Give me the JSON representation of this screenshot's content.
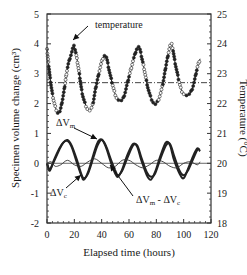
{
  "chart_data": {
    "type": "line",
    "title": "",
    "xlabel": "Elapsed time (hours)",
    "ylabel": "Specimen volume change (cm³)",
    "ylabel_right": "Temperature (°C)",
    "xlim": [
      0,
      120
    ],
    "ylim": [
      -2,
      5
    ],
    "ylim_right": [
      18,
      25
    ],
    "x_ticks": [
      0,
      20,
      40,
      60,
      80,
      100,
      120
    ],
    "y_ticks": [
      -2,
      -1,
      0,
      1,
      2,
      3,
      4,
      5
    ],
    "y_ticks_right": [
      18,
      19,
      20,
      21,
      22,
      23,
      24,
      25
    ],
    "grid": false,
    "reference_lines": [
      {
        "axis": "right",
        "value": 22.7,
        "style": "dash-dot",
        "label": "mean temperature"
      },
      {
        "axis": "left",
        "value": 0,
        "style": "solid-thin",
        "label": "zero volume change"
      }
    ],
    "annotations": [
      {
        "text": "temperature",
        "arrow_to": [
          20,
          23.9
        ],
        "axis": "right"
      },
      {
        "text": "ΔVm",
        "arrow_to": [
          38,
          0.75
        ],
        "axis": "left"
      },
      {
        "text": "ΔVc",
        "arrow_to": [
          26,
          -0.5
        ],
        "axis": "left"
      },
      {
        "text": "ΔVm - ΔVc",
        "arrow_to": [
          62,
          0.0
        ],
        "axis": "left"
      }
    ],
    "series": [
      {
        "name": "temperature",
        "axis": "right",
        "style": "markers+line",
        "x": [
          0,
          3,
          6,
          9,
          12,
          15,
          18,
          20,
          23,
          26,
          30,
          33,
          36,
          40,
          43,
          46,
          50,
          53,
          56,
          60,
          64,
          67,
          70,
          74,
          77,
          80,
          84,
          88,
          91,
          94,
          98,
          101,
          104,
          107,
          110,
          112
        ],
        "values": [
          23.8,
          22.6,
          21.9,
          21.7,
          22.3,
          23.2,
          23.7,
          23.9,
          23.2,
          22.3,
          21.8,
          21.9,
          22.6,
          23.4,
          23.6,
          23.0,
          22.3,
          22.1,
          22.2,
          22.9,
          23.6,
          23.9,
          23.4,
          22.5,
          22.1,
          22.0,
          22.5,
          23.5,
          24.0,
          23.3,
          22.5,
          22.3,
          22.3,
          22.6,
          23.2,
          23.5
        ]
      },
      {
        "name": "ΔVm",
        "axis": "left",
        "style": "thick-line",
        "x": [
          0,
          2,
          5,
          9,
          12,
          15,
          18,
          22,
          25,
          27,
          30,
          34,
          37,
          40,
          43,
          47,
          50,
          52,
          55,
          59,
          63,
          66,
          69,
          73,
          76,
          79,
          83,
          87,
          90,
          93,
          97,
          100,
          103,
          107,
          110,
          112
        ],
        "values": [
          0.0,
          -0.25,
          0.1,
          0.5,
          0.7,
          0.75,
          0.55,
          0.0,
          -0.4,
          -0.55,
          -0.3,
          0.3,
          0.7,
          0.8,
          0.55,
          0.0,
          -0.35,
          -0.45,
          -0.2,
          0.3,
          0.65,
          0.55,
          0.1,
          -0.4,
          -0.55,
          -0.3,
          0.25,
          0.7,
          0.6,
          0.1,
          -0.35,
          -0.5,
          -0.2,
          0.25,
          0.5,
          0.4
        ]
      },
      {
        "name": "ΔVc",
        "axis": "left",
        "style": "thick-line",
        "x": [
          0,
          2,
          5,
          9,
          12,
          15,
          18,
          22,
          25,
          27,
          30,
          34,
          37,
          40,
          43,
          47,
          50,
          52,
          55,
          59,
          63,
          66,
          69,
          73,
          76,
          79,
          83,
          87,
          90,
          93,
          97,
          100,
          103,
          107,
          110,
          112
        ],
        "values": [
          0.0,
          -0.2,
          0.05,
          0.45,
          0.7,
          0.78,
          0.6,
          0.1,
          -0.35,
          -0.5,
          -0.35,
          0.2,
          0.6,
          0.78,
          0.6,
          0.1,
          -0.25,
          -0.4,
          -0.25,
          0.2,
          0.6,
          0.6,
          0.2,
          -0.3,
          -0.45,
          -0.35,
          0.15,
          0.6,
          0.65,
          0.25,
          -0.25,
          -0.4,
          -0.25,
          0.15,
          0.45,
          0.45
        ]
      },
      {
        "name": "ΔVm - ΔVc",
        "axis": "left",
        "style": "thin-line",
        "x": [
          0,
          3,
          6,
          10,
          15,
          20,
          25,
          30,
          35,
          40,
          45,
          50,
          55,
          60,
          65,
          70,
          75,
          80,
          85,
          90,
          95,
          100,
          105,
          110,
          112
        ],
        "values": [
          0.0,
          0.05,
          -0.1,
          -0.05,
          0.1,
          -0.05,
          -0.1,
          0.05,
          0.15,
          0.0,
          -0.15,
          -0.1,
          0.1,
          0.1,
          -0.05,
          -0.15,
          -0.05,
          0.1,
          0.05,
          -0.1,
          -0.15,
          0.0,
          0.05,
          -0.05,
          0.05
        ]
      }
    ]
  }
}
